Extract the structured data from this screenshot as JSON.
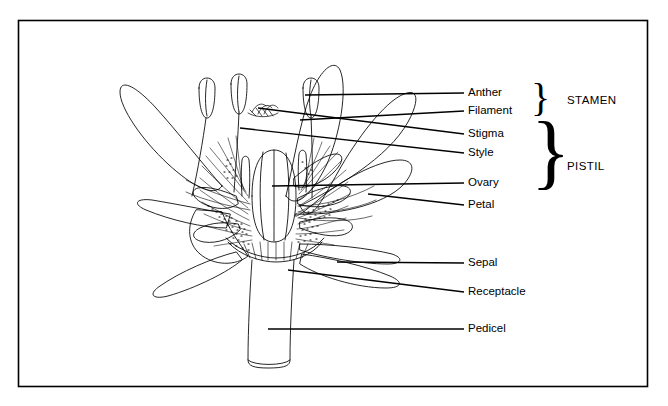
{
  "figure": {
    "type": "botanical-line-diagram",
    "border_color": "#000000",
    "line_color": "#000000",
    "background_color": "#ffffff"
  },
  "labels": [
    {
      "id": "anther",
      "text": "Anther",
      "x": 468,
      "y": 93,
      "leader_x1": 432,
      "leader_y1": 93,
      "leader_x2": 464,
      "leader_y2": 93,
      "pointer_x": 305,
      "pointer_y": 95
    },
    {
      "id": "filament",
      "text": "Filament",
      "x": 468,
      "y": 111,
      "leader_x1": 432,
      "leader_y1": 111,
      "leader_x2": 464,
      "leader_y2": 111,
      "pointer_x": 300,
      "pointer_y": 120
    },
    {
      "id": "stigma",
      "text": "Stigma",
      "x": 468,
      "y": 134,
      "leader_x1": 432,
      "leader_y1": 134,
      "leader_x2": 464,
      "leader_y2": 134,
      "pointer_x": 258,
      "pointer_y": 108
    },
    {
      "id": "style",
      "text": "Style",
      "x": 468,
      "y": 153,
      "leader_x1": 432,
      "leader_y1": 153,
      "leader_x2": 464,
      "leader_y2": 153,
      "pointer_x": 240,
      "pointer_y": 128
    },
    {
      "id": "ovary",
      "text": "Ovary",
      "x": 468,
      "y": 183,
      "leader_x1": 432,
      "leader_y1": 183,
      "leader_x2": 464,
      "leader_y2": 183,
      "pointer_x": 272,
      "pointer_y": 186
    },
    {
      "id": "petal",
      "text": "Petal",
      "x": 468,
      "y": 205,
      "leader_x1": 432,
      "leader_y1": 205,
      "leader_x2": 464,
      "leader_y2": 205,
      "pointer_x": 368,
      "pointer_y": 194
    },
    {
      "id": "sepal",
      "text": "Sepal",
      "x": 468,
      "y": 263,
      "leader_x1": 432,
      "leader_y1": 263,
      "leader_x2": 464,
      "leader_y2": 263,
      "pointer_x": 337,
      "pointer_y": 262
    },
    {
      "id": "receptacle",
      "text": "Receptacle",
      "x": 468,
      "y": 292,
      "leader_x1": 432,
      "leader_y1": 292,
      "leader_x2": 464,
      "leader_y2": 292,
      "pointer_x": 288,
      "pointer_y": 270
    },
    {
      "id": "pedicel",
      "text": "Pedicel",
      "x": 468,
      "y": 329,
      "leader_x1": 432,
      "leader_y1": 329,
      "leader_x2": 464,
      "leader_y2": 329,
      "pointer_x": 268,
      "pointer_y": 329
    }
  ],
  "groups": [
    {
      "id": "stamen",
      "text": "STAMEN",
      "brace_x": 531,
      "brace_y": 102,
      "brace_font_size": 40,
      "label_x": 567,
      "label_y": 101
    },
    {
      "id": "pistil",
      "text": "PISTIL",
      "brace_x": 531,
      "brace_y": 160,
      "brace_font_size": 82,
      "label_x": 567,
      "label_y": 167
    }
  ],
  "flower_parts": [
    "anther",
    "filament",
    "stigma",
    "style",
    "ovary",
    "petal",
    "sepal",
    "receptacle",
    "pedicel"
  ]
}
